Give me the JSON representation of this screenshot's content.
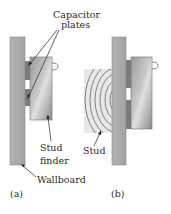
{
  "figure": {
    "panels": [
      {
        "id": "a",
        "caption": "(a)"
      },
      {
        "id": "b",
        "caption": "(b)"
      }
    ],
    "labels": {
      "capacitor_plates_line1": "Capacitor",
      "capacitor_plates_line2": "plates",
      "stud_finder_line1": "Stud",
      "stud_finder_line2": "finder",
      "wallboard": "Wallboard",
      "stud": "Stud"
    },
    "colors": {
      "wallboard": "#a9a9a9",
      "wallboard_edge": "#8a8a8a",
      "plate": "#7c7c7c",
      "stud_finder_light": "#d4d4d4",
      "stud_finder_dark": "#8e8e8e",
      "stud_wood": "#e8e8e6",
      "grain": "#555555",
      "text": "#2a2a2a"
    }
  }
}
